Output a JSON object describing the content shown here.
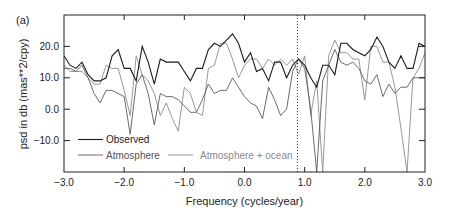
{
  "panel_label": "(a)",
  "chart_data": {
    "type": "line",
    "title": "",
    "panel_label": "(a)",
    "xlabel": "Frequency (cycles/year)",
    "ylabel": "psd in db (mas**2/cpy)",
    "xlim": [
      -3.0,
      3.0
    ],
    "ylim": [
      -20.0,
      30.0
    ],
    "xticks": [
      -3.0,
      -2.0,
      -1.0,
      0.0,
      1.0,
      2.0,
      3.0
    ],
    "xtick_labels": [
      "−3.0",
      "−2.0",
      "−1.0",
      "0.0",
      "1.0",
      "2.0",
      "3.0"
    ],
    "yticks": [
      -10.0,
      0.0,
      10.0,
      20.0
    ],
    "ytick_labels": [
      "−10.0",
      "0.0",
      "10.0",
      "20.0"
    ],
    "grid": false,
    "legend_position": "lower left",
    "annotations": [
      {
        "type": "vertical-dotted-line",
        "x": 0.88
      }
    ],
    "x": [
      -3.0,
      -2.9,
      -2.8,
      -2.7,
      -2.6,
      -2.5,
      -2.4,
      -2.3,
      -2.2,
      -2.1,
      -2.0,
      -1.9,
      -1.8,
      -1.7,
      -1.6,
      -1.5,
      -1.4,
      -1.3,
      -1.2,
      -1.1,
      -1.0,
      -0.9,
      -0.8,
      -0.7,
      -0.6,
      -0.5,
      -0.4,
      -0.3,
      -0.2,
      -0.1,
      0.0,
      0.1,
      0.2,
      0.3,
      0.4,
      0.5,
      0.6,
      0.7,
      0.8,
      0.9,
      1.0,
      1.1,
      1.2,
      1.3,
      1.4,
      1.5,
      1.6,
      1.7,
      1.8,
      1.9,
      2.0,
      2.1,
      2.2,
      2.3,
      2.4,
      2.5,
      2.6,
      2.7,
      2.8,
      2.9,
      3.0
    ],
    "series": [
      {
        "name": "Observed",
        "color": "#1a1a1a",
        "width": 1.1,
        "values": [
          17,
          14,
          13,
          15,
          11,
          9,
          9,
          10,
          17,
          19,
          13,
          13,
          9,
          20,
          15,
          8,
          16,
          15,
          15,
          15,
          12,
          9,
          13,
          13,
          19,
          21,
          20,
          22,
          24,
          21,
          15,
          18,
          12,
          13,
          9,
          15,
          15,
          10,
          14,
          16,
          14,
          10,
          7,
          14,
          14,
          11,
          21,
          21,
          19,
          18,
          17,
          19,
          23,
          20,
          15,
          13,
          17,
          13,
          13,
          21,
          20
        ]
      },
      {
        "name": "Atmosphere",
        "color": "#5a5a5a",
        "width": 0.9,
        "values": [
          13,
          13,
          12,
          14,
          10,
          5,
          2,
          6,
          6,
          5,
          4,
          -8,
          8,
          11,
          5,
          -5,
          5,
          4,
          4,
          3,
          1,
          -1,
          -1,
          3,
          8,
          5,
          6,
          6,
          10,
          7,
          4,
          2,
          1,
          -3,
          7,
          3,
          -2,
          0,
          12,
          16,
          13,
          0,
          -20,
          9,
          14,
          19,
          15,
          14,
          15,
          13,
          9,
          8,
          11,
          4,
          8,
          5,
          7,
          7,
          10,
          10,
          10
        ]
      },
      {
        "name": "Atmosphere + ocean",
        "color": "#8c8c8c",
        "width": 0.9,
        "values": [
          14,
          12,
          12,
          12,
          10,
          8,
          8,
          14,
          13,
          13,
          6,
          -2,
          17,
          11,
          9,
          5,
          -2,
          2,
          -3,
          -7,
          7,
          5,
          -1,
          -2,
          13,
          14,
          21,
          21,
          16,
          10,
          14,
          16,
          16,
          13,
          16,
          14,
          16,
          14,
          16,
          11,
          17,
          -2,
          9,
          -20,
          17,
          22,
          18,
          18,
          16,
          16,
          3,
          20,
          20,
          15,
          15,
          7,
          -6,
          -20,
          10,
          13,
          18
        ]
      }
    ]
  }
}
